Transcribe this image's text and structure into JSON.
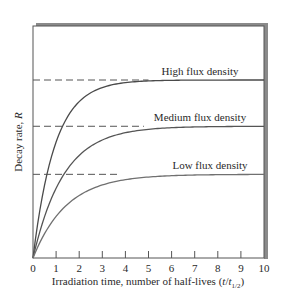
{
  "chart_data": {
    "type": "line",
    "title": "",
    "xlabel": "Irradiation time, number of half-lives (t/t1/2)",
    "xlabel_main": "Irradiation time, number of half-lives (",
    "xlabel_t": "t",
    "xlabel_slash": "/",
    "xlabel_t2": "t",
    "xlabel_sub": "1/2",
    "xlabel_close": ")",
    "ylabel": "Decay rate, R",
    "ylabel_main": "Decay rate, ",
    "ylabel_R": "R",
    "xlim": [
      0,
      10
    ],
    "ylim": [
      0,
      1.3
    ],
    "xticks": [
      "0",
      "1",
      "2",
      "3",
      "4",
      "5",
      "6",
      "7",
      "8",
      "9",
      "10"
    ],
    "grid": false,
    "legend": "inline labels above saturation lines",
    "series": [
      {
        "name": "High flux density",
        "saturation": 1.0,
        "model": "R = Rsat(1 - 2^(-t/t1/2 * k))",
        "x": [
          0,
          1,
          2,
          3,
          4,
          5,
          6,
          7,
          8,
          9,
          10
        ],
        "values": [
          0,
          0.6,
          0.85,
          0.94,
          0.98,
          0.99,
          1.0,
          1.0,
          1.0,
          1.0,
          1.0
        ]
      },
      {
        "name": "Medium flux density",
        "saturation": 0.74,
        "x": [
          0,
          1,
          2,
          3,
          4,
          5,
          6,
          7,
          8,
          9,
          10
        ],
        "values": [
          0,
          0.37,
          0.56,
          0.65,
          0.7,
          0.72,
          0.73,
          0.74,
          0.74,
          0.74,
          0.74
        ]
      },
      {
        "name": "Low flux density",
        "saturation": 0.47,
        "x": [
          0,
          1,
          2,
          3,
          4,
          5,
          6,
          7,
          8,
          9,
          10
        ],
        "values": [
          0,
          0.24,
          0.36,
          0.42,
          0.45,
          0.46,
          0.47,
          0.47,
          0.47,
          0.47,
          0.47
        ]
      }
    ],
    "annotations": [
      "dashed horizontal saturation lines from y-axis to curves"
    ]
  },
  "colors": {
    "axis": "#555555",
    "curve_high": "#4a4a4a",
    "curve_medium": "#555555",
    "curve_low": "#707070",
    "dash": "#555555",
    "frame_shadow": "#8a8a8a",
    "text": "#2a2a2a"
  }
}
